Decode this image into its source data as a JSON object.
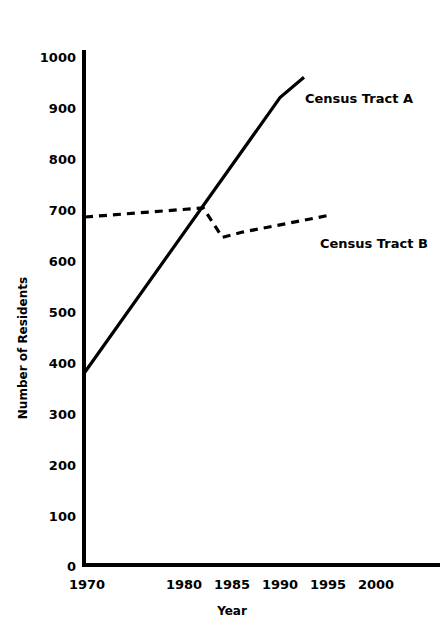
{
  "chart_data": {
    "type": "line",
    "title": "",
    "subtitle": "",
    "xlabel": "Year",
    "ylabel": "Number of Residents",
    "xlim": [
      1970,
      2002
    ],
    "ylim": [
      0,
      1000
    ],
    "grid": false,
    "legend_position": "inline-right-of-series",
    "x_tick_labels": [
      "1970",
      "1980",
      "1985",
      "1990",
      "1995",
      "2000"
    ],
    "x_tick_values": [
      1970,
      1980,
      1985,
      1990,
      1995,
      2000
    ],
    "y_tick_labels": [
      "0",
      "100",
      "200",
      "300",
      "400",
      "500",
      "600",
      "700",
      "800",
      "900",
      "1000"
    ],
    "y_tick_values": [
      0,
      100,
      200,
      300,
      400,
      500,
      600,
      700,
      800,
      900,
      1000
    ],
    "series": [
      {
        "name": "Census Tract A",
        "style": "solid",
        "label_text": "Census Tract A",
        "x": [
          1970,
          1990,
          1992.5
        ],
        "values": [
          380,
          920,
          960
        ]
      },
      {
        "name": "Census Tract B",
        "style": "dashed",
        "label_text": "Census Tract B",
        "x": [
          1970,
          1982,
          1984,
          1986,
          1995
        ],
        "values": [
          685,
          703,
          645,
          655,
          688
        ]
      }
    ],
    "annotations": [
      {
        "text": "Census Tract A",
        "series": "Census Tract A"
      },
      {
        "text": "Census Tract B",
        "series": "Census Tract B"
      }
    ],
    "colors": {
      "axis": "#000000",
      "series_a": "#000000",
      "series_b": "#000000",
      "background": "#ffffff"
    }
  },
  "axes": {
    "y_title": "Number of Residents",
    "x_title": "Year",
    "y_ticks": [
      "1000",
      "900",
      "800",
      "700",
      "600",
      "500",
      "400",
      "300",
      "200",
      "100",
      "0"
    ],
    "x_ticks": [
      "1970",
      "1980",
      "1985",
      "1990",
      "1995",
      "2000"
    ]
  },
  "labels": {
    "series_a": "Census Tract A",
    "series_b": "Census Tract B"
  }
}
